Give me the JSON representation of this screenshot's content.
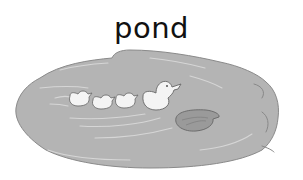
{
  "title": "pond",
  "illustration": {
    "subject": "pond",
    "elements": [
      "mother-duck",
      "duckling",
      "duckling",
      "duckling",
      "lily-pad"
    ],
    "colors": {
      "water": "#b4b4b4",
      "water_edge": "#8a8a8a",
      "ripple": "#d6d6d6",
      "duck": "#f4f4f4",
      "outline": "#555555",
      "lily_pad": "#9a9a9a",
      "background": "#ffffff",
      "text": "#111111"
    }
  }
}
